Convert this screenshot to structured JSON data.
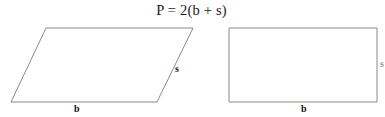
{
  "figure": {
    "formula": "P = 2(b + s)",
    "shapes": [
      {
        "name": "parallelogram",
        "base_label": "b",
        "side_label": "s",
        "vertices": [
          [
            46,
            28
          ],
          [
            193,
            28
          ],
          [
            157,
            102
          ],
          [
            11,
            102
          ]
        ]
      },
      {
        "name": "rectangle",
        "base_label": "b",
        "side_label": "s",
        "vertices": [
          [
            229,
            28
          ],
          [
            377,
            28
          ],
          [
            377,
            102
          ],
          [
            229,
            102
          ]
        ]
      }
    ],
    "stroke_color": "#8a8a8a",
    "text_color": "#1b1b1b",
    "background_color": "#ffffff"
  }
}
